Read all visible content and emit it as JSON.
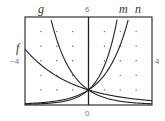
{
  "chart_data": {
    "type": "line",
    "title": "",
    "xlabel": "",
    "ylabel": "",
    "xlim": [
      -4,
      4
    ],
    "ylim": [
      0,
      6
    ],
    "grid": "dots at integer points",
    "tick_labels": {
      "x_min": "-4",
      "x_max": "4",
      "y_min": "0",
      "y_max": "6"
    },
    "series": [
      {
        "name": "f",
        "description": "decreasing exponential, gentle",
        "points": [
          [
            -4,
            3.8
          ],
          [
            -2,
            1.95
          ],
          [
            0,
            1
          ],
          [
            2,
            0.51
          ],
          [
            4,
            0.26
          ]
        ]
      },
      {
        "name": "g",
        "description": "decreasing exponential, steep",
        "points": [
          [
            -2.4,
            6
          ],
          [
            -2,
            4
          ],
          [
            -1,
            2
          ],
          [
            0,
            1
          ],
          [
            2,
            0.25
          ],
          [
            4,
            0.06
          ]
        ]
      },
      {
        "name": "m",
        "description": "increasing exponential, steep",
        "points": [
          [
            -4,
            0.02
          ],
          [
            -2,
            0.15
          ],
          [
            0,
            1
          ],
          [
            1,
            2.6
          ],
          [
            1.85,
            6
          ]
        ]
      },
      {
        "name": "n",
        "description": "increasing exponential, gentle",
        "points": [
          [
            -4,
            0.06
          ],
          [
            -2,
            0.25
          ],
          [
            0,
            1
          ],
          [
            2,
            4
          ],
          [
            2.55,
            6
          ]
        ]
      }
    ],
    "intersection": [
      0,
      1
    ]
  },
  "labels": {
    "g": "g",
    "m": "m",
    "n": "n",
    "f": "f",
    "y_top": "6",
    "y_bottom": "0",
    "x_left": "−4",
    "x_right": "4"
  }
}
